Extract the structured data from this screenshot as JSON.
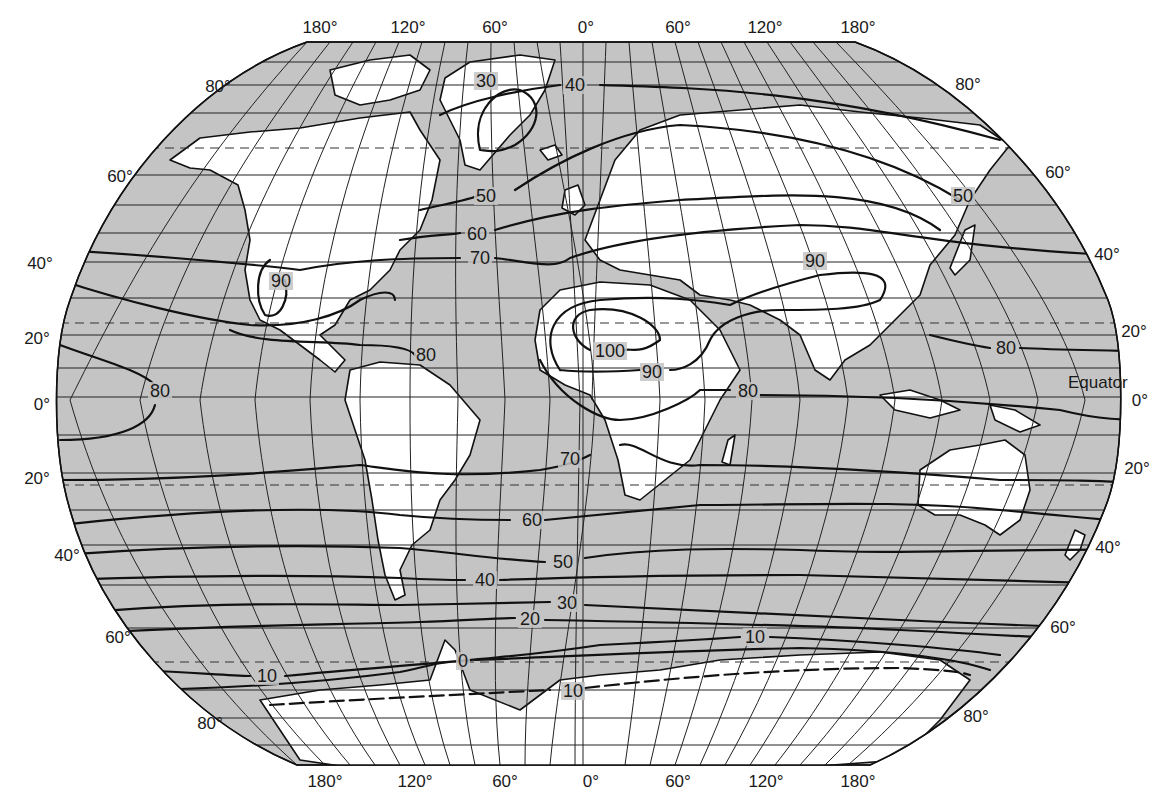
{
  "map": {
    "type": "world isotherm map",
    "projection": "Robinson-like pseudocylindrical",
    "colors": {
      "ocean": "#c4c4c4",
      "land": "#ffffff",
      "lines": "#111111"
    },
    "longitude_labels_top": [
      "180°",
      "120°",
      "60°",
      "0°",
      "60°",
      "120°",
      "180°"
    ],
    "longitude_labels_bottom": [
      "180°",
      "120°",
      "60°",
      "0°",
      "60°",
      "120°",
      "180°"
    ],
    "latitude_labels_left": [
      "80°",
      "60°",
      "40°",
      "20°",
      "0°",
      "20°",
      "40°",
      "60°",
      "80°"
    ],
    "latitude_labels_right": [
      "80°",
      "60°",
      "40°",
      "20°",
      "0°",
      "20°",
      "40°",
      "60°",
      "80°"
    ],
    "equator_label": "Equator",
    "isotherm_labels": [
      {
        "value": "40",
        "region": "North Atlantic / Iceland"
      },
      {
        "value": "30",
        "region": "Greenland"
      },
      {
        "value": "50",
        "region": "North Atlantic"
      },
      {
        "value": "60",
        "region": "North Atlantic"
      },
      {
        "value": "70",
        "region": "North Atlantic"
      },
      {
        "value": "90",
        "region": "Southwestern North America"
      },
      {
        "value": "80",
        "region": "Caribbean"
      },
      {
        "value": "80",
        "region": "Eastern Pacific"
      },
      {
        "value": "100",
        "region": "Sahara"
      },
      {
        "value": "90",
        "region": "Central Africa"
      },
      {
        "value": "80",
        "region": "Horn of Africa / Indian Ocean"
      },
      {
        "value": "90",
        "region": "Central Asia"
      },
      {
        "value": "50",
        "region": "Northeast Asia"
      },
      {
        "value": "80",
        "region": "Western Pacific"
      },
      {
        "value": "70",
        "region": "South Atlantic"
      },
      {
        "value": "60",
        "region": "South Atlantic"
      },
      {
        "value": "50",
        "region": "Southern Ocean"
      },
      {
        "value": "40",
        "region": "Southern Ocean"
      },
      {
        "value": "30",
        "region": "Southern Ocean"
      },
      {
        "value": "20",
        "region": "Southern Ocean"
      },
      {
        "value": "10",
        "region": "Southern Ocean (Indian sector)"
      },
      {
        "value": "10",
        "region": "Southern Ocean (Pacific sector)"
      },
      {
        "value": "0",
        "region": "Weddell Sea"
      },
      {
        "value": "10",
        "region": "Antarctica coast (dashed)"
      }
    ]
  }
}
